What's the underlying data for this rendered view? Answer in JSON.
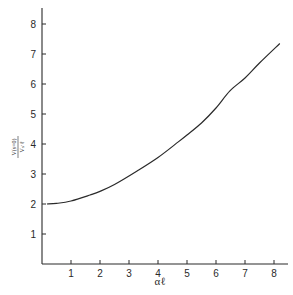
{
  "chart_data": {
    "type": "line",
    "title": "",
    "xlabel": "αℓ",
    "ylabel_numerator": "V(s=0)",
    "ylabel_denominator": "Vₛ·ℓ",
    "xlim": [
      0,
      8.5
    ],
    "ylim": [
      0,
      8.5
    ],
    "xticks": [
      1,
      2,
      3,
      4,
      5,
      6,
      7,
      8
    ],
    "yticks": [
      1,
      2,
      3,
      4,
      5,
      6,
      7,
      8
    ],
    "grid": false,
    "legend": null,
    "series": [
      {
        "name": "curve",
        "x": [
          0.17,
          0.5,
          1.0,
          1.66,
          2.0,
          2.5,
          3.28,
          4.0,
          4.7,
          5.0,
          5.5,
          6.0,
          6.48,
          7.0,
          7.5,
          8.2
        ],
        "y": [
          2.0,
          2.02,
          2.1,
          2.3,
          2.42,
          2.65,
          3.1,
          3.55,
          4.07,
          4.3,
          4.7,
          5.2,
          5.77,
          6.2,
          6.7,
          7.35
        ]
      }
    ]
  }
}
